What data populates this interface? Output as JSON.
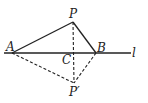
{
  "diagram": {
    "type": "geometry-reflection",
    "points": {
      "A": {
        "label": "A",
        "x": 12,
        "y": 53
      },
      "P": {
        "label": "P",
        "x": 73,
        "y": 22
      },
      "B": {
        "label": "B",
        "x": 96,
        "y": 53
      },
      "C": {
        "label": "C",
        "x": 73,
        "y": 53
      },
      "P_prime": {
        "label": "P′",
        "x": 74,
        "y": 83
      }
    },
    "line": {
      "label": "l"
    },
    "segments_solid": [
      "AP",
      "PB",
      "AB (on line l)"
    ],
    "segments_dashed": [
      "PP′",
      "AP′",
      "BP′"
    ],
    "stroke_color": "#222222"
  }
}
